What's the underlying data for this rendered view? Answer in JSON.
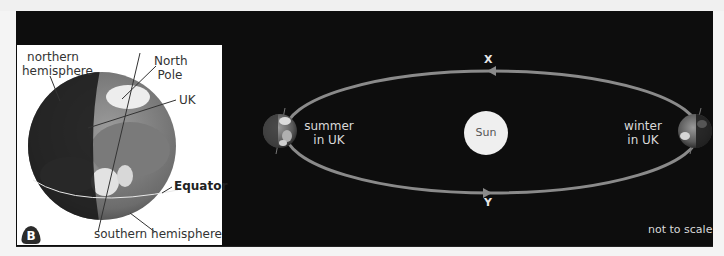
{
  "figure": {
    "panel_b": {
      "badge": "B",
      "labels": {
        "northern_hemisphere": [
          "northern",
          "hemisphere"
        ],
        "north_pole": [
          "North",
          "Pole"
        ],
        "uk": "UK",
        "equator": "Equator",
        "southern_hemisphere": "southern hemisphere"
      }
    },
    "orbit": {
      "sun": "Sun",
      "summer": [
        "summer",
        "in UK"
      ],
      "winter": [
        "winter",
        "in UK"
      ],
      "top_marker": "X",
      "bottom_marker": "Y",
      "note": "not to scale"
    },
    "colors": {
      "background": "#0d0d0d",
      "panel": "#ffffff",
      "orbit_line": "#8a8a8a",
      "sun": "#efefef",
      "label_light": "#d9d9d9",
      "label_dark": "#333333"
    }
  }
}
